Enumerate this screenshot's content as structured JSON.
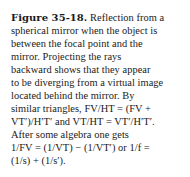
{
  "figure": {
    "label": "Figure 35-18.",
    "lines": [
      " Reflection from a",
      "spherical mirror when the object is",
      "between the focal point and the",
      "mirror. Projecting the rays",
      "backward shows that they appear",
      "to be diverging from a virtual image",
      "located behind the mirror. By",
      "similar triangles, FV/HT = (FV +",
      "VT′)/H′T′ and VT/HT = VT′/H′T′.",
      "After some algebra one gets",
      "1/FV = (1/VT) − (1/VT′) or 1/f =",
      "(1/s) + (1/s′)."
    ]
  }
}
